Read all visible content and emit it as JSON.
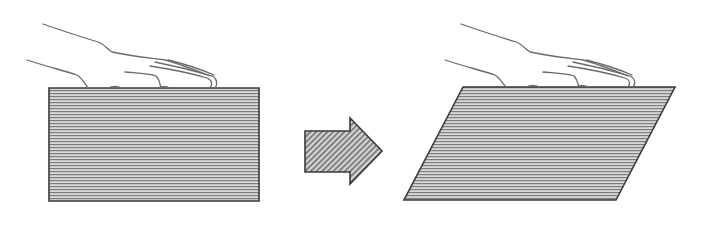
{
  "diagram": {
    "colors": {
      "background": "#ffffff",
      "outline": "#3a3a3a",
      "hatch_line": "#8a8a8a",
      "fill": "#d2d2d2",
      "hand_line": "#6a6a6a"
    },
    "before": {
      "label": "Undeformed block",
      "shape": "rectangle",
      "points": [
        [
          49,
          88
        ],
        [
          259,
          88
        ],
        [
          259,
          201
        ],
        [
          49,
          201
        ]
      ]
    },
    "arrow": {
      "label": "Deformation direction",
      "icon": "right-arrow-icon",
      "points": [
        [
          305,
          131
        ],
        [
          350,
          131
        ],
        [
          350,
          118
        ],
        [
          382,
          151
        ],
        [
          350,
          184
        ],
        [
          350,
          172
        ],
        [
          305,
          172
        ]
      ]
    },
    "after": {
      "label": "Sheared block",
      "shape": "parallelogram",
      "points": [
        [
          463,
          87
        ],
        [
          675,
          87
        ],
        [
          616,
          200
        ],
        [
          404,
          200
        ]
      ]
    },
    "hand_offset_x": 418
  }
}
